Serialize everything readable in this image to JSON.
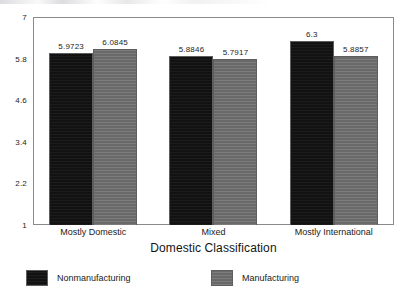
{
  "chart_data": {
    "type": "bar",
    "title": "",
    "xlabel": "Domestic Classification",
    "ylabel": "",
    "categories": [
      "Mostly Domestic",
      "Mixed",
      "Mostly International"
    ],
    "series": [
      {
        "name": "Nonmanufacturing",
        "color": "#121212",
        "values": [
          5.9723,
          5.8846,
          6.3
        ],
        "labels": [
          "5.9723",
          "5.8846",
          "6.3"
        ]
      },
      {
        "name": "Manufacturing",
        "color": "#6d6d6d",
        "values": [
          6.0845,
          5.7917,
          5.8857
        ],
        "labels": [
          "6.0845",
          "5.7917",
          "5.8857"
        ]
      }
    ],
    "ylim": [
      1,
      7
    ],
    "yticks": [
      7,
      5.8,
      4.6,
      3.4,
      2.2,
      1
    ],
    "ytick_labels": [
      "7",
      "5.8",
      "4.6",
      "3.4",
      "2.2",
      "1"
    ],
    "grid": false,
    "legend_position": "bottom",
    "bar_gap_within_group": 0,
    "frame": true
  },
  "legend": {
    "items": [
      {
        "label": "Nonmanufacturing",
        "color": "#121212"
      },
      {
        "label": "Manufacturing",
        "color": "#6d6d6d"
      }
    ]
  }
}
